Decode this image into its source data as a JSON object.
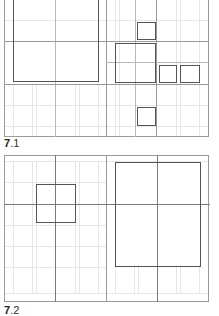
{
  "figures": [
    {
      "id": "7.1",
      "label_number": "7",
      "label_sub": ".1"
    },
    {
      "id": "7.2",
      "label_number": "7",
      "label_sub": ".2"
    }
  ],
  "colors": {
    "grid_strong": "#9a9a9a",
    "grid_faint": "#e6e6e6",
    "box_stroke": "#555555",
    "background": "#ffffff"
  }
}
